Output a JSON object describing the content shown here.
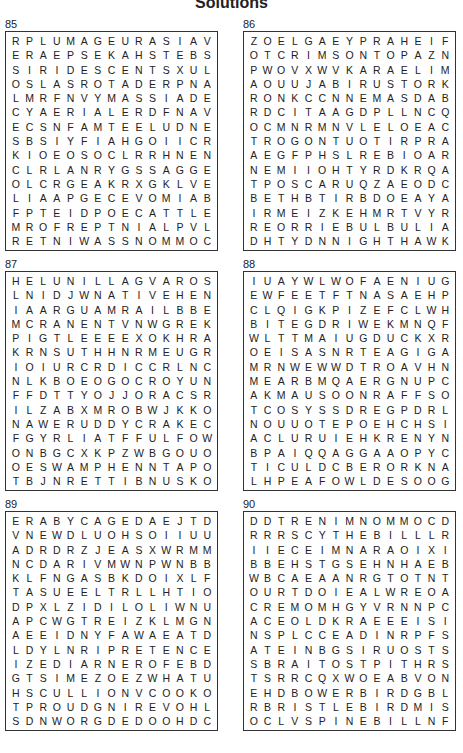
{
  "page": {
    "title": "Solutions"
  },
  "puzzles": [
    {
      "number": "85",
      "rows": [
        "RPLUMAGEURASIAV",
        "ERAEPSEKAHSTEBS",
        "SIRIDESCENTSXUL",
        "OSLASROTADERPNA",
        "LMRFNVYMASSIADE",
        "CYAERIALERDFNAV",
        "ECSNFAMTEELUDNE",
        "SBSIYFIAHGOIICR",
        "KIOEOSOCLRRHNEN",
        "CLRLANRYGSSAGGE",
        "OLCRGEAKRXGKLVE",
        "LIAAPGECEVOMIAB",
        "FPTEIDPOECATTLE",
        "MROFREPTNIALPVL",
        "RETNIWASSNOMMOC"
      ]
    },
    {
      "number": "86",
      "rows": [
        "ZOELGAEYPRAHEIF",
        "OTCRIMSONTOPAZN",
        "PWOVXWVKARAELIM",
        "AOUUJABIRUSTORK",
        "RONKCCNNEMASDAB",
        "RDCITAAGDPLLNCQ",
        "OCMNRMNVLELOEAC",
        "TROGONTUOTIRPRA",
        "AEGFPHSLREBIOAR",
        "NEMIIOHTYRDKRQA",
        "TPOSCARUQZAEODC",
        "BETHBTIRBDOEAYA",
        "IRMEIZKEHMRTVYR",
        "REORRIEBULBULIA",
        "DHTYDNNIGHTHAWK"
      ]
    },
    {
      "number": "87",
      "rows": [
        "HELUNILLAGVAROS",
        "LNIDJWNATIVEHEN",
        "IAARGUAMRAILBBE",
        "MCRANENTVNWGREK",
        "PIGTLEEEEXOKHRA",
        "KRNSUTHHNRMEUGR",
        "IOIURCRDICCRLNC",
        "NLKBOEOGOCROYUN",
        "FFDTTYOJJORACSR",
        "ILZABXMROBWJKKO",
        "NAWERUDDYCRAKEC",
        "FGYRLIATFFULFOW",
        "ONBGCXKPZWBGOUO",
        "OESWAMPHENNTAPO",
        "TBJNRETTIBNUSKO"
      ]
    },
    {
      "number": "88",
      "rows": [
        "IUAYWLWOFAENIUG",
        "EWFEETFTNASAEHP",
        "CLQIGKPIZEFCLWH",
        "BITEGDRIWEKMNQF",
        "WLTTMAIUGDUCKXR",
        "OEISASNRTEAGIGA",
        "MRNWEWWDTROAVHN",
        "MEARBMQAERGNUPC",
        "AKMAUSOONRAFFSO",
        "TCOSYSSDREGPDRL",
        "NOUUOTEPOEHCHSI",
        "ACLURUIEHKRENYN",
        "BPAIQQAGGAAOPYC",
        "TICULDCBERORKNA",
        "LHPEAFOWLDESOOG"
      ]
    },
    {
      "number": "89",
      "rows": [
        "ERABYCAGEDAEJTD",
        "VNEWDLUOHSOIIUU",
        "ADRDRZJEASXWRMM",
        "NCDARIVMWNPWNBB",
        "KLFNGASBKDOIXLF",
        "TASUEELTRLLHTIO",
        "DPXLZIDILOLIWNU",
        "APCWGTREIZKLMGN",
        "AEEIDNYFAWAEATD",
        "LDYLNRIPRETENCE",
        "IZEDIARNEROFEBD",
        "GTSIMEZOEZWHATU",
        "HSCULLIONVCOOKO",
        "TPROUDGNIREVOHL",
        "SDNWORGDEDOOHDC"
      ]
    },
    {
      "number": "90",
      "rows": [
        "DDTRENIMNOMMOCD",
        "RRRSCYTHEBILLLR",
        "IIECEIMNARAOIXI",
        "BBEHSTGSEHNHAEB",
        "WBCAEAANRGTOTNT",
        "OURTDOIEALWREOA",
        "CREMOMHGYVRNNPC",
        "ACEOLDKRAEEEISI",
        "NSPLCCEADINRPFS",
        "ATEINBGSIRUOSTS",
        "SBRAITOSTPITHRS",
        "TSRRCQXWOEABVON",
        "EHDBOWERBIRDGBL",
        "RBRISTLEBIRDMIS",
        "OCLVSPINEBILLNF"
      ]
    }
  ]
}
